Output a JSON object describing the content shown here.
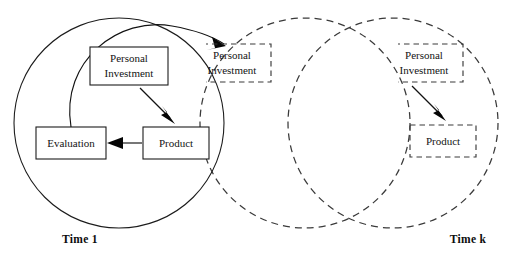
{
  "figure": {
    "type": "recursive-cycle-diagram",
    "background_color": "#ffffff",
    "stroke_color": "#1c1c1c",
    "dashed_stroke_color": "#3a3a3a",
    "width": 511,
    "height": 259
  },
  "cycles": [
    {
      "id": "cycle-1",
      "style": "solid",
      "time_label": "Time 1",
      "time_label_position": {
        "x": 80,
        "y": 239
      },
      "circle": {
        "cx": 119,
        "cy": 123,
        "r": 105
      },
      "boxes": [
        {
          "id": "personal-investment-1",
          "line1": "Personal",
          "line2": "Investment",
          "style": "solid",
          "x": 90,
          "y": 47,
          "w": 78,
          "h": 38
        },
        {
          "id": "product-1",
          "line1": "Product",
          "line2": "",
          "style": "solid",
          "x": 143,
          "y": 127,
          "w": 66,
          "h": 32
        },
        {
          "id": "evaluation-1",
          "line1": "Evaluation",
          "line2": "",
          "style": "solid",
          "x": 36,
          "y": 127,
          "w": 70,
          "h": 32
        }
      ]
    },
    {
      "id": "cycle-2",
      "style": "dashed",
      "time_label": "",
      "circle": {
        "cx": 305,
        "cy": 123,
        "r": 105
      },
      "boxes": [
        {
          "id": "personal-investment-2",
          "line1": "Personal",
          "line2": "Investment",
          "style": "dashed",
          "x": 193,
          "y": 44,
          "w": 78,
          "h": 38,
          "occluded": true
        }
      ]
    },
    {
      "id": "cycle-k",
      "style": "dashed",
      "time_label": "Time k",
      "time_label_position": {
        "x": 468,
        "y": 239
      },
      "circle": {
        "cx": 393,
        "cy": 123,
        "r": 105
      },
      "boxes": [
        {
          "id": "personal-investment-k",
          "line1": "Personal",
          "line2": "Investment",
          "style": "dashed",
          "x": 385,
          "y": 44,
          "w": 78,
          "h": 38,
          "occluded": true
        },
        {
          "id": "product-k",
          "line1": "Product",
          "line2": "",
          "style": "dashed",
          "x": 410,
          "y": 125,
          "w": 66,
          "h": 32
        }
      ]
    }
  ],
  "arrows": [
    {
      "id": "arrow-investment-to-product-1",
      "from": "personal-investment-1",
      "to": "product-1",
      "style": "solid-straight"
    },
    {
      "id": "arrow-product-to-evaluation-1",
      "from": "product-1",
      "to": "evaluation-1",
      "style": "solid-straight"
    },
    {
      "id": "arrow-evaluation-to-investment-2",
      "from": "evaluation-1",
      "to": "personal-investment-2",
      "style": "solid-curved-arc"
    },
    {
      "id": "arrow-investment-to-product-k",
      "from": "personal-investment-k",
      "to": "product-k",
      "style": "solid-straight"
    }
  ],
  "labels": {
    "personal": "Personal",
    "investment": "Investment",
    "product": "Product",
    "evaluation": "Evaluation",
    "time_1": "Time 1",
    "time_k": "Time k"
  }
}
